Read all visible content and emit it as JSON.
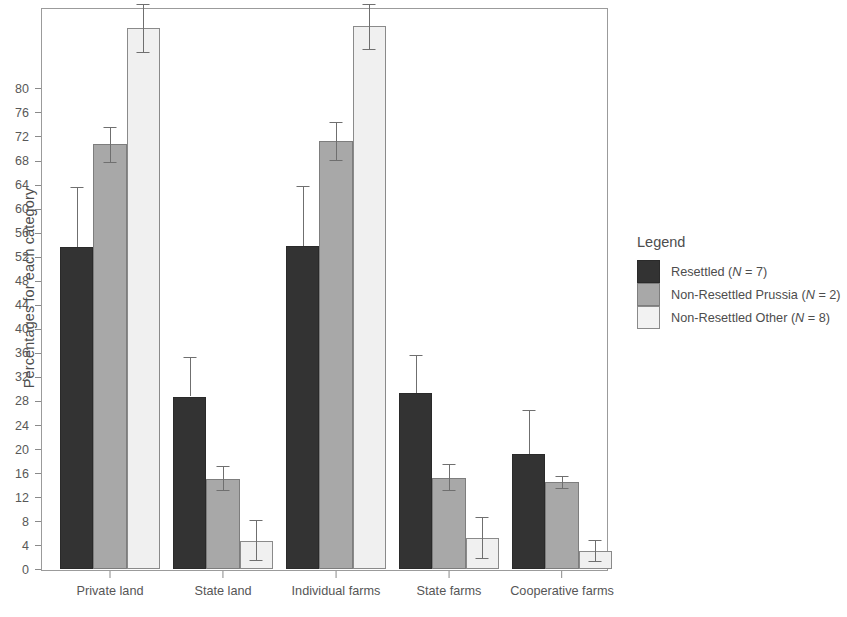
{
  "chart_data": {
    "type": "bar",
    "title": "",
    "subtitle": "",
    "xlabel": "",
    "ylabel": "Percentages for each category",
    "categories": [
      "Private land",
      "State land",
      "Individual farms",
      "State farms",
      "Cooperative farms"
    ],
    "ylim": [
      0,
      92
    ],
    "yticks": [
      0,
      4,
      8,
      12,
      16,
      20,
      24,
      28,
      32,
      36,
      40,
      44,
      48,
      52,
      56,
      60,
      64,
      68,
      72,
      76,
      80
    ],
    "ytick_labels": [
      "0",
      "4",
      "8",
      "12",
      "16",
      "20",
      "24",
      "28",
      "32",
      "36",
      "40",
      "44",
      "48",
      "52",
      "56",
      "60",
      "64",
      "68",
      "72",
      "76",
      "80"
    ],
    "grid": false,
    "legend_position": "right",
    "bar_order_in_group": [
      "Non-Resettled Other",
      "Non-Resettled Prussia",
      "Resettled"
    ],
    "series": [
      {
        "name": "Non-Resettled Other (N = 8)",
        "short_name": "Non-Resettled Other",
        "color": "#f0f0f0",
        "values": [
          90.0,
          4.7,
          90.3,
          5.1,
          3.0
        ],
        "err_low": [
          86.0,
          1.5,
          86.5,
          1.8,
          1.3
        ],
        "err_high": [
          94.0,
          8.1,
          94.0,
          8.6,
          4.8
        ]
      },
      {
        "name": "Non-Resettled Prussia (N = 2)",
        "short_name": "Non-Resettled Prussia",
        "color": "#a8a8a8",
        "values": [
          70.7,
          15.0,
          71.2,
          15.2,
          14.4
        ],
        "err_low": [
          67.7,
          13.1,
          68.0,
          13.2,
          13.5
        ],
        "err_high": [
          73.5,
          17.1,
          74.3,
          17.4,
          15.5
        ]
      },
      {
        "name": "Resettled (N = 7)",
        "short_name": "Resettled",
        "color": "#333333",
        "values": [
          53.5,
          28.7,
          53.8,
          29.2,
          19.2
        ],
        "err_low": [
          53.5,
          28.7,
          53.8,
          29.2,
          19.2
        ],
        "err_high": [
          63.6,
          35.2,
          63.8,
          35.6,
          26.5
        ]
      }
    ]
  },
  "legend": {
    "title": "Legend",
    "items": [
      {
        "label_prefix": "Resettled (",
        "n_symbol": "N",
        "label_suffix": " = 7)",
        "swatch": "dark"
      },
      {
        "label_prefix": "Non-Resettled Prussia (",
        "n_symbol": "N",
        "label_suffix": " = 2)",
        "swatch": "mid"
      },
      {
        "label_prefix": "Non-Resettled Other (",
        "n_symbol": "N",
        "label_suffix": " = 8)",
        "swatch": "light"
      }
    ]
  }
}
